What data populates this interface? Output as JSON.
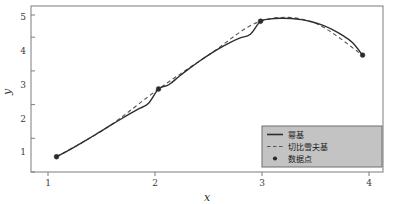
{
  "chart_data": {
    "type": "line",
    "title": "",
    "xlabel": "x",
    "ylabel": "y",
    "xlim": [
      0.75,
      4.2
    ],
    "ylim": [
      0.55,
      5.45
    ],
    "xticks": [
      "1",
      "2",
      "3",
      "4"
    ],
    "xtick_values": [
      1,
      2,
      3,
      4
    ],
    "yticks": [
      "1",
      "2",
      "3",
      "4",
      "5"
    ],
    "ytick_values": [
      1,
      2,
      3,
      4,
      5
    ],
    "grid": false,
    "legend_position": "lower-right",
    "series": [
      {
        "name": "幂基",
        "style": "solid",
        "color": "#2e2e2e",
        "x": [
          1.0,
          1.1,
          1.2,
          1.3,
          1.4,
          1.5,
          1.6,
          1.7,
          1.8,
          1.9,
          2.0,
          2.1,
          2.2,
          2.3,
          2.4,
          2.5,
          2.6,
          2.7,
          2.8,
          2.9,
          3.0,
          3.1,
          3.2,
          3.3,
          3.4,
          3.5,
          3.6,
          3.7,
          3.8,
          3.9,
          4.0
        ],
        "values": [
          1.0,
          1.1585,
          1.328,
          1.5055,
          1.688,
          1.8725,
          2.056,
          2.2355,
          2.408,
          2.5705,
          3.0,
          3.1255,
          3.368,
          3.6005,
          3.82,
          4.0235,
          4.208,
          4.3705,
          4.508,
          4.6175,
          5.0,
          5.0705,
          5.088,
          5.0805,
          5.048,
          4.9865,
          4.892,
          4.7605,
          4.588,
          4.3705,
          4.0
        ]
      },
      {
        "name": "切比雪夫基",
        "style": "dashed",
        "color": "#555555",
        "x": [
          1.0,
          1.5,
          2.0,
          2.5,
          3.0,
          3.5,
          4.0
        ],
        "values": [
          1.0,
          1.8725,
          3.0,
          4.0235,
          5.0,
          4.9865,
          4.0
        ]
      },
      {
        "name": "数据点",
        "style": "markers",
        "color": "#2b2b2b",
        "x": [
          1,
          2,
          3,
          4
        ],
        "values": [
          1,
          3,
          5,
          4
        ]
      }
    ]
  },
  "legend": {
    "entries": [
      {
        "label": "幂基",
        "marker": "solid-line"
      },
      {
        "label": "切比雪夫基",
        "marker": "dashed-line"
      },
      {
        "label": "数据点",
        "marker": "dot"
      }
    ]
  },
  "axes": {
    "x_title": "x",
    "y_title": "y"
  },
  "colors": {
    "power_basis": "#2e2e2e",
    "chebyshev_basis": "#555555",
    "datapoint": "#2b2b2b",
    "frame": "#7d7d7d",
    "legend_bg": "#c3c3c3",
    "legend_border": "#6f6f6f",
    "background": "#ffffff"
  }
}
